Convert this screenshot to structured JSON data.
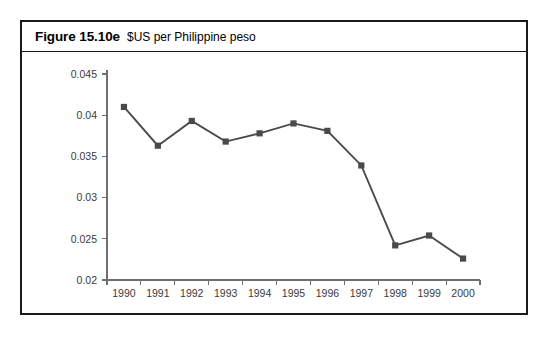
{
  "figure": {
    "number": "Figure 15.10e",
    "caption": "$US per Philippine peso"
  },
  "chart_data": {
    "type": "line",
    "title": "$US per Philippine peso",
    "xlabel": "",
    "ylabel": "",
    "categories": [
      "1990",
      "1991",
      "1992",
      "1993",
      "1994",
      "1995",
      "1996",
      "1997",
      "1998",
      "1999",
      "2000"
    ],
    "values": [
      0.041,
      0.0363,
      0.0393,
      0.0368,
      0.0378,
      0.039,
      0.0381,
      0.0339,
      0.0242,
      0.0254,
      0.0226
    ],
    "series": [
      {
        "name": "$US per Philippine peso",
        "values": [
          0.041,
          0.0363,
          0.0393,
          0.0368,
          0.0378,
          0.039,
          0.0381,
          0.0339,
          0.0242,
          0.0254,
          0.0226
        ]
      }
    ],
    "ylim": [
      0.02,
      0.045
    ],
    "yticks": [
      0.02,
      0.025,
      0.03,
      0.035,
      0.04,
      0.045
    ],
    "ytick_labels": [
      "0.02",
      "0.025",
      "0.03",
      "0.035",
      "0.04",
      "0.045"
    ],
    "xtick_labels": [
      "1990",
      "1991",
      "1992",
      "1993",
      "1994",
      "1995",
      "1996",
      "1997",
      "1998",
      "1999",
      "2000"
    ],
    "grid": false,
    "legend": "none",
    "marker": "square",
    "line_color": "#4a4a4a",
    "marker_color": "#4a4a4a",
    "axis_color": "#6f6f6f"
  }
}
